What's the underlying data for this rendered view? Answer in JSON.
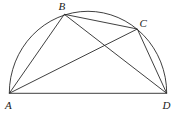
{
  "diagram": {
    "points": {
      "A": {
        "label": "A",
        "x": 9.3,
        "y": 93.3,
        "label_x": 5,
        "label_y": 109
      },
      "B": {
        "label": "B",
        "x": 64.3,
        "y": 14.3,
        "label_x": 58.5,
        "label_y": 10
      },
      "C": {
        "label": "C",
        "x": 137.3,
        "y": 29,
        "label_x": 139.5,
        "label_y": 27
      },
      "D": {
        "label": "D",
        "x": 166.7,
        "y": 93.3,
        "label_x": 162.5,
        "label_y": 109
      }
    },
    "segments": [
      [
        "A",
        "D"
      ],
      [
        "A",
        "B"
      ],
      [
        "B",
        "C"
      ],
      [
        "C",
        "D"
      ],
      [
        "A",
        "C"
      ],
      [
        "B",
        "D"
      ]
    ],
    "arc": {
      "from": "A",
      "to": "D",
      "rx": 78.7,
      "ry": 82,
      "type": "semicircle"
    },
    "stroke_color": "#2a2a2a"
  }
}
